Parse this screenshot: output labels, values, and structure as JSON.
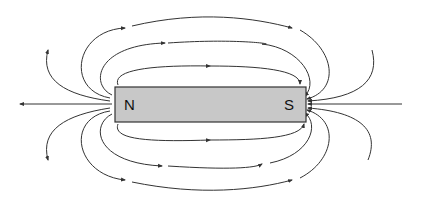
{
  "diagram": {
    "magnet": {
      "north_label": "N",
      "south_label": "S",
      "fill": "#c8c8c8",
      "stroke": "#333333"
    },
    "line_color": "#333333",
    "field_direction": "north-to-south"
  }
}
